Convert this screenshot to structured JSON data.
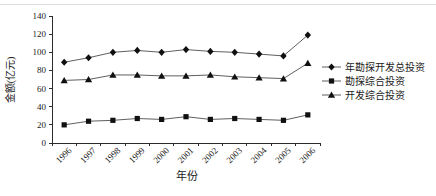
{
  "figure": {
    "background": "#ffffff",
    "top_rule_color": "#dedede"
  },
  "chart_data": {
    "type": "line",
    "title": "",
    "xlabel": "年份",
    "ylabel": "金额(亿元)",
    "categories": [
      "1996",
      "1997",
      "1998",
      "1999",
      "2000",
      "2001",
      "2002",
      "2003",
      "2004",
      "2005",
      "2006"
    ],
    "ylim": [
      0,
      140
    ],
    "ytick_step": 20,
    "yticks": [
      0,
      20,
      40,
      60,
      80,
      100,
      120,
      140
    ],
    "grid": false,
    "legend_position": "right",
    "series": [
      {
        "name": "年勘探开发总投资",
        "marker": "diamond",
        "values": [
          89,
          94,
          100,
          102,
          100,
          103,
          101,
          100,
          98,
          96,
          119
        ]
      },
      {
        "name": "勘探综合投资",
        "marker": "square",
        "values": [
          20,
          24,
          25,
          27,
          26,
          29,
          26,
          27,
          26,
          25,
          31
        ]
      },
      {
        "name": "开发综合投资",
        "marker": "triangle",
        "values": [
          69,
          70,
          75,
          75,
          74,
          74,
          75,
          73,
          72,
          71,
          88
        ]
      }
    ],
    "colors": {
      "line": "#5f5f5f",
      "marker": "#101010",
      "axis": "#2b2b2b",
      "text": "#1a1a1a"
    }
  }
}
